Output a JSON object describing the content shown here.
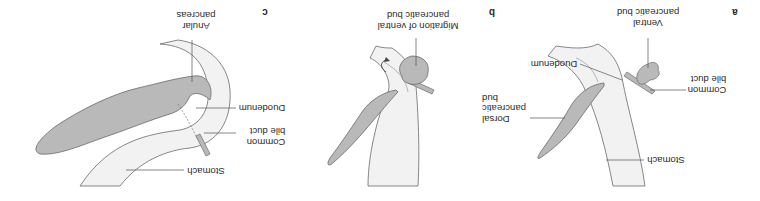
{
  "figure": {
    "orientation": "rotated 180 degrees",
    "panels": [
      {
        "id": "a",
        "letter": "a",
        "labels": {
          "ventral_bud": [
            "Ventral",
            "pancreatic bud"
          ],
          "common_bile_duct": [
            "Common",
            "bile duct"
          ],
          "duodenum": [
            "Duodenum"
          ],
          "dorsal_bud": [
            "Dorsal",
            "pancreatic",
            "bud"
          ],
          "stomach": [
            "Stomach"
          ]
        }
      },
      {
        "id": "b",
        "letter": "b",
        "labels": {
          "migration": [
            "Migration of ventral",
            "pancreatic bud"
          ]
        }
      },
      {
        "id": "c",
        "letter": "c",
        "labels": {
          "anular_pancreas": [
            "Anular",
            "pancreas"
          ],
          "duodenum": [
            "Duodenum"
          ],
          "common_bile_duct": [
            "Common",
            "bile duct"
          ],
          "stomach": [
            "Stomach"
          ]
        }
      }
    ],
    "colors": {
      "pancreas_fill": "#b9b9b9",
      "gut_fill": "#f2f2f2",
      "outline": "#6a6a6a",
      "leader_line": "#555555",
      "text": "#2b2b2b"
    }
  }
}
